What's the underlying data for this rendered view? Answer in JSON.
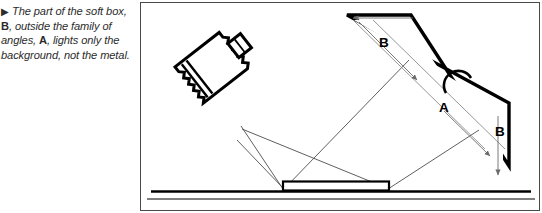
{
  "caption": {
    "marker": "▶",
    "segments": [
      {
        "text": "The part of the soft box, ",
        "style": "italic"
      },
      {
        "text": "B",
        "style": "bold"
      },
      {
        "text": ", outside the family of angles, ",
        "style": "italic"
      },
      {
        "text": "A",
        "style": "bold"
      },
      {
        "text": ", lights only the background, not the metal.",
        "style": "italic"
      }
    ],
    "full_text": "▶ The part of the soft box, B, outside the family of angles, A, lights only the background, not the metal."
  },
  "figure": {
    "frame": {
      "x": 140,
      "y": 2,
      "width": 400,
      "height": 209,
      "border_color": "#4a4a4a"
    },
    "labels": {
      "panel_top_b": "B",
      "panel_mid_a": "A",
      "panel_bottom_b": "B"
    },
    "elements": {
      "softbox": "soft-box-light-source",
      "reflector_panel": "angled-soft-box-panel",
      "metal_subject": "metal-subject-block",
      "ground": "ground-line",
      "light_rays": "family-of-angles-rays",
      "eye_arc": "camera-viewpoint-arc"
    },
    "colors": {
      "ink": "#000000",
      "ray": "#555555",
      "frame": "#4a4a4a",
      "paper": "#ffffff"
    }
  }
}
